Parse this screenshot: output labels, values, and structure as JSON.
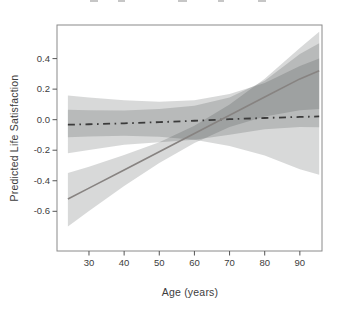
{
  "chart_data": {
    "type": "line",
    "title": "",
    "xlabel": "Age (years)",
    "ylabel": "Predicted Life Satisfaction",
    "x_domain": [
      20.9,
      96.3
    ],
    "y_domain": [
      -0.86,
      0.62
    ],
    "x_ticks": [
      {
        "value": 30,
        "label": "30"
      },
      {
        "value": 40,
        "label": "40"
      },
      {
        "value": 50,
        "label": "50"
      },
      {
        "value": 60,
        "label": "60"
      },
      {
        "value": 70,
        "label": "70"
      },
      {
        "value": 80,
        "label": "80"
      },
      {
        "value": 90,
        "label": "90"
      }
    ],
    "y_ticks": [
      {
        "value": 0.4,
        "label": "0.4"
      },
      {
        "value": 0.2,
        "label": "0.2"
      },
      {
        "value": 0.0,
        "label": "0.0"
      },
      {
        "value": -0.2,
        "label": "-0.2"
      },
      {
        "value": -0.4,
        "label": "-0.4"
      },
      {
        "value": -0.6,
        "label": "-0.6"
      }
    ],
    "ages": [
      24,
      30,
      40,
      50,
      60,
      70,
      80,
      90,
      95.5
    ],
    "series": [
      {
        "name": "flat-dashdot-line",
        "style": "dashdot",
        "color": "#3b3b3b",
        "width": 1.8,
        "values": [
          -0.033,
          -0.03,
          -0.024,
          -0.016,
          -0.007,
          0.003,
          0.011,
          0.018,
          0.021
        ]
      },
      {
        "name": "rising-solid-line",
        "style": "solid",
        "color": "#878381",
        "width": 1.6,
        "values": [
          -0.52,
          -0.448,
          -0.329,
          -0.21,
          -0.09,
          0.029,
          0.148,
          0.267,
          0.32
        ]
      }
    ],
    "bands": [
      {
        "name": "flat-line-ci-band-a",
        "top": [
          0.158,
          0.146,
          0.128,
          0.118,
          0.128,
          0.168,
          0.24,
          0.352,
          0.4
        ],
        "bottom": [
          -0.115,
          -0.11,
          -0.105,
          -0.112,
          -0.132,
          -0.172,
          -0.235,
          -0.325,
          -0.36
        ]
      },
      {
        "name": "flat-line-ci-band-b",
        "top": [
          0.065,
          0.062,
          0.06,
          0.07,
          0.092,
          0.145,
          0.255,
          0.43,
          0.5
        ],
        "bottom": [
          -0.22,
          -0.198,
          -0.165,
          -0.148,
          -0.132,
          -0.098,
          -0.062,
          -0.048,
          -0.05
        ]
      },
      {
        "name": "rising-line-ci-band",
        "top": [
          -0.35,
          -0.308,
          -0.232,
          -0.148,
          -0.04,
          0.1,
          0.268,
          0.47,
          0.575
        ],
        "bottom": [
          -0.7,
          -0.598,
          -0.435,
          -0.284,
          -0.152,
          -0.048,
          0.02,
          0.062,
          0.07
        ]
      }
    ],
    "band_fill": "#2e3436",
    "band_opacity": 0.19,
    "frame_color": "#8a8a8a",
    "tick_color": "#555555",
    "label_color": "#3d3d3d",
    "plot_area": {
      "left": 57,
      "right": 322,
      "top": 25,
      "bottom": 251
    },
    "legend": "none",
    "grid": "off"
  }
}
